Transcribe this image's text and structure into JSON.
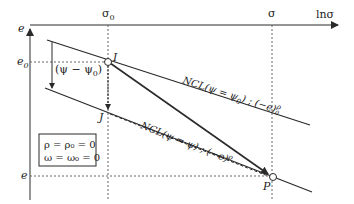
{
  "axes": {
    "x_label": "lnσ",
    "y_label": "e"
  },
  "ticks": {
    "sigma0": "σ",
    "sigma0_sub": "0",
    "sigma": "σ",
    "e0": "e",
    "e0_sub": "0",
    "e": "e"
  },
  "points": {
    "I": "I",
    "J": "J",
    "P": "P"
  },
  "annotations": {
    "psi_diff": "(ψ − ψ",
    "psi_diff_sub": "0",
    "psi_diff_close": ")"
  },
  "lines": {
    "upper_ncl_prefix": "NCL(ψ = ψ",
    "upper_ncl_sub": "0",
    "upper_ncl_mid": ") ; (−e)",
    "upper_ncl_sup": "ρ",
    "upper_ncl_supsub": "0",
    "lower_ncl_prefix": "NCL(ψ = ψ) ; (−e)",
    "lower_ncl_sup": "ρ"
  },
  "conditions": {
    "line1": "ρ = ρ₀ = 0",
    "line2": "ω = ω₀ = 0"
  },
  "colors": {
    "line": "#2a2a2a",
    "dotted": "#666666"
  }
}
